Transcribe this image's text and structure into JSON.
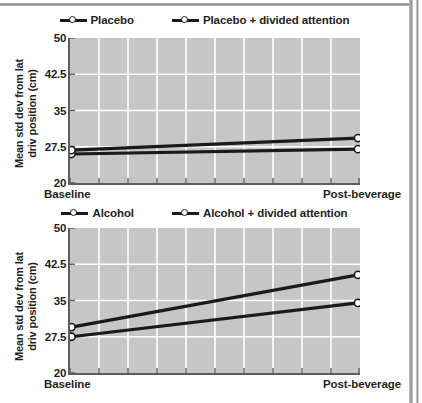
{
  "figure": {
    "axis": {
      "y_title_line1": "Mean std dev from lat",
      "y_title_line2": "driv position (cm)",
      "y_ticks": [
        "50",
        "42.5",
        "35",
        "27.5",
        "20"
      ],
      "y_min": 20,
      "y_max": 50,
      "x_label_left": "Baseline",
      "x_label_right": "Post-beverage"
    },
    "colors": {
      "plot_background": "#c6c6c6",
      "gridline": "#ffffff",
      "series_line": "#1a1a1a",
      "axis": "#5d5d5d",
      "text": "#1f1f1f"
    }
  },
  "chart_data": [
    {
      "type": "line",
      "title": "",
      "xlabel": "",
      "ylabel": "Mean std dev from lat driv position (cm)",
      "categories": [
        "Baseline",
        "Post-beverage"
      ],
      "x": [
        0,
        1
      ],
      "ylim": [
        20,
        50
      ],
      "yticks": [
        20,
        27.5,
        35,
        42.5,
        50
      ],
      "grid": true,
      "legend_position": "top",
      "series": [
        {
          "name": "Placebo",
          "values": [
            26.0,
            27.0
          ]
        },
        {
          "name": "Placebo + divided attention",
          "values": [
            26.8,
            29.3
          ]
        }
      ]
    },
    {
      "type": "line",
      "title": "",
      "xlabel": "",
      "ylabel": "Mean std dev from lat driv position (cm)",
      "categories": [
        "Baseline",
        "Post-beverage"
      ],
      "x": [
        0,
        1
      ],
      "ylim": [
        20,
        50
      ],
      "yticks": [
        20,
        27.5,
        35,
        42.5,
        50
      ],
      "grid": true,
      "legend_position": "top",
      "series": [
        {
          "name": "Alcohol",
          "values": [
            27.5,
            34.5
          ]
        },
        {
          "name": "Alcohol + divided attention",
          "values": [
            29.5,
            40.3
          ]
        }
      ]
    }
  ]
}
